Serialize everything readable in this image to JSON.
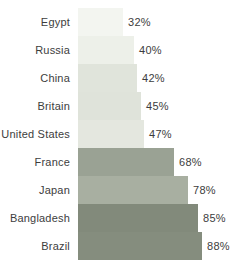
{
  "chart_data": {
    "type": "bar",
    "orientation": "horizontal",
    "title": "",
    "xlabel": "",
    "ylabel": "",
    "categories": [
      "Egypt",
      "Russia",
      "China",
      "Britain",
      "United States",
      "France",
      "Japan",
      "Bangladesh",
      "Brazil"
    ],
    "values": [
      32,
      40,
      42,
      45,
      47,
      68,
      78,
      85,
      88
    ],
    "value_labels": [
      "32%",
      "40%",
      "42%",
      "45%",
      "47%",
      "68%",
      "78%",
      "85%",
      "88%"
    ],
    "bar_colors": [
      "#f3f5f0",
      "#edf0e9",
      "#e0e4db",
      "#dfe3da",
      "#e4e7df",
      "#9aa294",
      "#a8afa1",
      "#828a7b",
      "#858d7e"
    ],
    "xlim": [
      0,
      100
    ],
    "grid": false,
    "legend": false,
    "background": "#ffffff",
    "text_color": "#3d3d3d"
  }
}
